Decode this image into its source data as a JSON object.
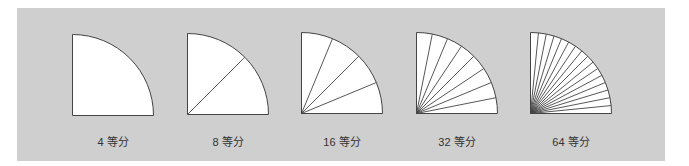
{
  "diagram": {
    "background": "#cfcfcf",
    "shape_fill": "#ffffff",
    "stroke_color": "#444444",
    "figures": [
      {
        "label": "4 等分",
        "sectors": 1,
        "left": 72,
        "top": 34,
        "size": 82
      },
      {
        "label": "8 等分",
        "sectors": 2,
        "left": 187,
        "top": 33,
        "size": 82
      },
      {
        "label": "16 等分",
        "sectors": 4,
        "left": 301,
        "top": 32,
        "size": 82
      },
      {
        "label": "32 等分",
        "sectors": 8,
        "left": 416,
        "top": 32,
        "size": 82
      },
      {
        "label": "64 等分",
        "sectors": 16,
        "left": 530,
        "top": 32,
        "size": 82
      }
    ]
  }
}
